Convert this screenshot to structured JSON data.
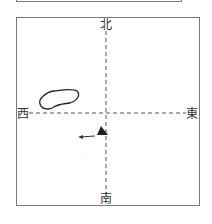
{
  "compass": {
    "north": "北",
    "south": "南",
    "west": "西",
    "east": "東"
  },
  "elements": {
    "island": "island-outline",
    "ship": "ship-triangle",
    "motion_arrow": "left-arrow",
    "axis_style": "dashed"
  },
  "colors": {
    "frame": "#7a7a7a",
    "axis": "#555555",
    "ink": "#222222"
  }
}
